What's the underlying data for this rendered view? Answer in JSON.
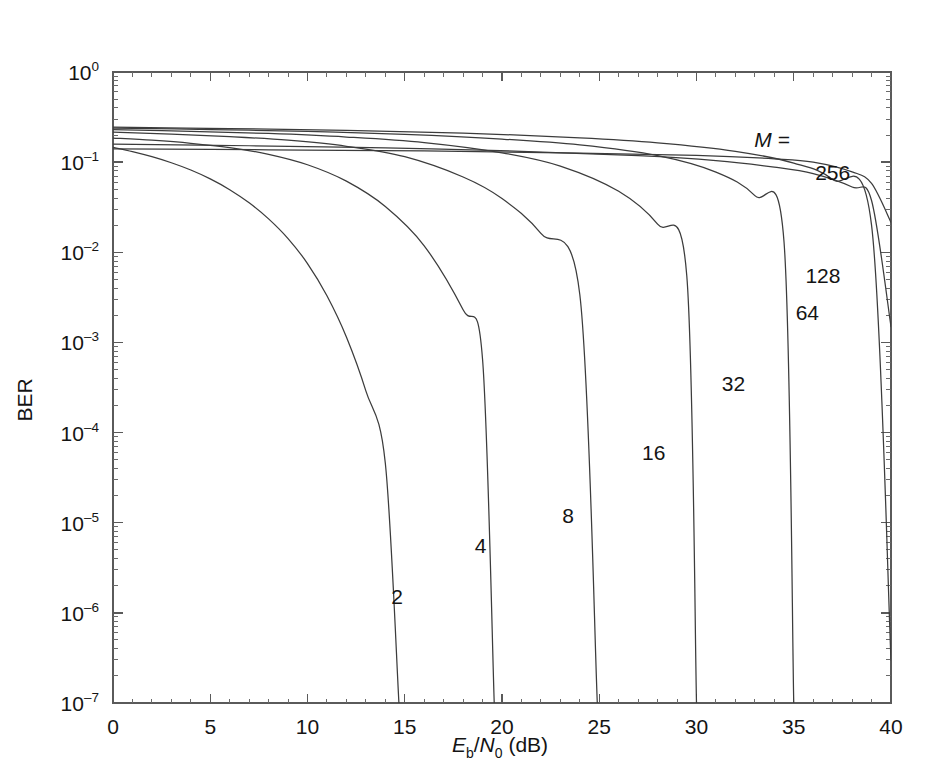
{
  "chart_data": {
    "type": "line",
    "title": "",
    "subtitle": "",
    "xlabel": "Eb/N0 (dB)",
    "xlabel_parts": {
      "sym1": "E",
      "sub1": "b",
      "slash": "/",
      "sym2": "N",
      "sub2": "0",
      "unit": " (dB)"
    },
    "ylabel": "BER",
    "xlim": [
      0,
      40
    ],
    "ylim": [
      1e-07,
      1
    ],
    "xscale": "linear",
    "yscale": "log",
    "grid": false,
    "legend_position": "inline-annotations",
    "legend_title": "M =",
    "xticks": [
      0,
      5,
      10,
      15,
      20,
      25,
      30,
      35,
      40
    ],
    "xticklabels": [
      "0",
      "5",
      "10",
      "15",
      "20",
      "25",
      "30",
      "35",
      "40"
    ],
    "yticks": [
      1,
      0.1,
      0.01,
      0.001,
      0.0001,
      1e-05,
      1e-06,
      1e-07
    ],
    "yticklabels": [
      "10^0",
      "10^-1",
      "10^-2",
      "10^-3",
      "10^-4",
      "10^-5",
      "10^-6",
      "10^-7"
    ],
    "ytick_mantissa": "10",
    "ytick_exponents": [
      "0",
      "-1",
      "-2",
      "-3",
      "-4",
      "-5",
      "-6",
      "-7"
    ],
    "minor_ticks": true,
    "curve_color": "#3c3c3c",
    "axis_color": "#5a5a5a",
    "background": "#ffffff",
    "series": [
      {
        "name": "2",
        "label": "2",
        "label_x": 14.6,
        "label_y": 1.5e-06,
        "x": [
          0,
          1,
          2,
          3,
          4,
          5,
          6,
          7,
          8,
          9,
          10,
          11,
          12,
          13,
          14,
          14.7
        ],
        "y": [
          0.146,
          0.131,
          0.115,
          0.0985,
          0.0818,
          0.0652,
          0.0495,
          0.0354,
          0.0235,
          0.0142,
          0.0075,
          0.0033,
          0.00115,
          0.00029,
          4.6e-05,
          1e-07
        ]
      },
      {
        "name": "4",
        "label": "4",
        "label_x": 18.9,
        "label_y": 5.5e-06,
        "x": [
          0,
          2,
          4,
          6,
          8,
          10,
          12,
          14,
          16,
          18,
          19,
          19.6
        ],
        "y": [
          0.185,
          0.175,
          0.162,
          0.145,
          0.122,
          0.0935,
          0.0615,
          0.0322,
          0.0118,
          0.0023,
          0.00065,
          1e-07
        ]
      },
      {
        "name": "8",
        "label": "8",
        "label_x": 23.4,
        "label_y": 1.2e-05,
        "x": [
          0,
          3,
          6,
          9,
          12,
          15,
          18,
          20,
          22,
          24,
          24.9
        ],
        "y": [
          0.215,
          0.205,
          0.192,
          0.175,
          0.15,
          0.115,
          0.0685,
          0.0395,
          0.0162,
          0.0034,
          1e-07
        ]
      },
      {
        "name": "16",
        "label": "16",
        "label_x": 27.8,
        "label_y": 6e-05,
        "x": [
          0,
          4,
          8,
          12,
          16,
          20,
          23,
          26,
          28,
          29.5,
          30.0
        ],
        "y": [
          0.23,
          0.22,
          0.208,
          0.19,
          0.165,
          0.127,
          0.0905,
          0.0475,
          0.0205,
          0.0055,
          1e-07
        ]
      },
      {
        "name": "32",
        "label": "32",
        "label_x": 31.9,
        "label_y": 0.00035,
        "x": [
          0,
          5,
          10,
          15,
          20,
          24,
          28,
          31,
          33,
          34.5,
          35.0
        ],
        "y": [
          0.238,
          0.23,
          0.219,
          0.203,
          0.18,
          0.155,
          0.118,
          0.0775,
          0.0425,
          0.013,
          1e-07
        ]
      },
      {
        "name": "64",
        "label": "64",
        "label_x": 35.7,
        "label_y": 0.0021,
        "x": [
          0,
          6,
          12,
          18,
          24,
          28,
          32,
          35,
          37,
          39,
          40
        ],
        "y": [
          0.244,
          0.236,
          0.225,
          0.21,
          0.186,
          0.164,
          0.132,
          0.0975,
          0.064,
          0.02,
          3e-07
        ]
      },
      {
        "name": "128",
        "label": "128",
        "label_x": 36.5,
        "label_y": 0.0054,
        "x": [
          0,
          7,
          14,
          21,
          27,
          31,
          34,
          36,
          38,
          39,
          40
        ],
        "y": [
          0.158,
          0.152,
          0.144,
          0.132,
          0.118,
          0.104,
          0.088,
          0.0745,
          0.053,
          0.0375,
          0.0015
        ]
      },
      {
        "name": "256",
        "label": "256",
        "label_x": 37.0,
        "label_y": 0.076,
        "x": [
          0,
          8,
          16,
          24,
          30,
          34,
          36,
          38,
          39,
          40
        ],
        "y": [
          0.14,
          0.137,
          0.133,
          0.126,
          0.119,
          0.109,
          0.1,
          0.078,
          0.058,
          0.0215
        ]
      }
    ]
  },
  "axes": {
    "y_axis_title": "BER",
    "legend_annotation": "M =",
    "x_tick_labels": [
      "0",
      "5",
      "10",
      "15",
      "20",
      "25",
      "30",
      "35",
      "40"
    ],
    "y_tick_base": "10",
    "y_tick_exponents": [
      "0",
      "–1",
      "–2",
      "–3",
      "–4",
      "–5",
      "–6",
      "–7"
    ],
    "x_title_E": "E",
    "x_title_b": "b",
    "x_title_slash": "/",
    "x_title_N": "N",
    "x_title_0": "0",
    "x_title_unit": "(dB)"
  }
}
